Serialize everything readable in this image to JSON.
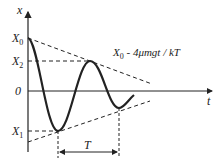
{
  "diagram": {
    "type": "damped-oscillation-friction",
    "axes": {
      "x_label": "x",
      "t_label": "t",
      "origin_label": "0"
    },
    "y_markers": [
      {
        "name": "X0",
        "label": "X",
        "sub": "0"
      },
      {
        "name": "X2",
        "label": "X",
        "sub": "2"
      },
      {
        "name": "X1",
        "label": "X",
        "sub": "1"
      }
    ],
    "envelope_label": {
      "base": "X",
      "sub": "0",
      "rest": " - 4μmgt / kT"
    },
    "period_label": "T",
    "colors": {
      "stroke": "#222222",
      "background": "#ffffff"
    }
  }
}
